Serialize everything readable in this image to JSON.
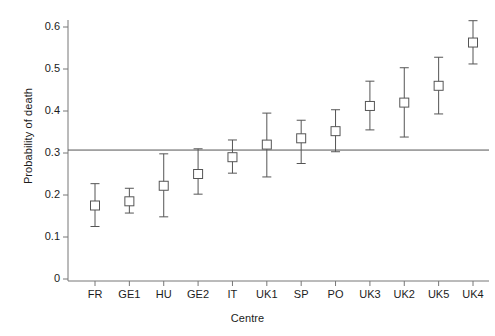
{
  "chart_data": {
    "type": "scatter",
    "title": "",
    "xlabel": "Centre",
    "ylabel": "Probability of death",
    "categories": [
      "FR",
      "GE1",
      "HU",
      "GE2",
      "IT",
      "UK1",
      "SP",
      "PO",
      "UK3",
      "UK2",
      "UK5",
      "UK4"
    ],
    "values": [
      0.175,
      0.185,
      0.222,
      0.25,
      0.29,
      0.32,
      0.335,
      0.352,
      0.412,
      0.42,
      0.46,
      0.563
    ],
    "lower": [
      0.125,
      0.157,
      0.148,
      0.202,
      0.252,
      0.243,
      0.275,
      0.303,
      0.355,
      0.338,
      0.393,
      0.512
    ],
    "upper": [
      0.227,
      0.216,
      0.298,
      0.31,
      0.331,
      0.395,
      0.378,
      0.403,
      0.471,
      0.503,
      0.528,
      0.615
    ],
    "errorbar_style": "capped-vertical",
    "marker": "open-square",
    "reference_line": 0.307,
    "reference_line_label": "",
    "ylim": [
      0,
      0.635
    ],
    "yticks": [
      0,
      0.1,
      0.2,
      0.3,
      0.4,
      0.5,
      0.6
    ],
    "ytick_labels": [
      "0",
      "0.1",
      "0.2",
      "0.3",
      "0.4",
      "0.5",
      "0.6"
    ],
    "grid": false,
    "legend": "none",
    "axis_color": "#777777",
    "marker_color": "#555555",
    "line_color": "#555555"
  }
}
